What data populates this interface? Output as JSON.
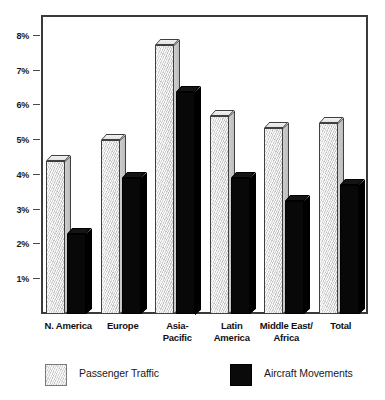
{
  "chart_data": {
    "type": "bar",
    "title": "",
    "subtitle": "",
    "xlabel": "",
    "ylabel": "",
    "categories": [
      "N. America",
      "Europe",
      "Asia-Pacific",
      "Latin America",
      "Middle East/ Africa",
      "Total"
    ],
    "category_lines": [
      [
        "N. America"
      ],
      [
        "Europe"
      ],
      [
        "Asia-",
        "Pacific"
      ],
      [
        "Latin",
        "America"
      ],
      [
        "Middle East/",
        "Africa"
      ],
      [
        "Total"
      ]
    ],
    "series": [
      {
        "name": "Passenger Traffic",
        "color": "#dcdcdc",
        "values": [
          4.4,
          5.0,
          7.75,
          5.7,
          5.35,
          5.5
        ]
      },
      {
        "name": "Aircraft Movements",
        "color": "#0a0a0a",
        "values": [
          2.3,
          3.9,
          6.4,
          3.9,
          3.25,
          3.7
        ]
      }
    ],
    "ylim": [
      0,
      8.6
    ],
    "yticks": [
      1,
      2,
      3,
      4,
      5,
      6,
      7,
      8
    ],
    "ytick_labels": [
      "1%",
      "2%",
      "3%",
      "4%",
      "5%",
      "6%",
      "7%",
      "8%"
    ],
    "value_suffix": "%",
    "grid": false,
    "legend_position": "bottom",
    "frame_color": "#3a3a3a",
    "background": "#ffffff"
  },
  "legend": {
    "items": [
      {
        "label": "Passenger Traffic",
        "swatch": "light-gray-swatch"
      },
      {
        "label": "Aircraft Movements",
        "swatch": "black-swatch"
      }
    ]
  }
}
